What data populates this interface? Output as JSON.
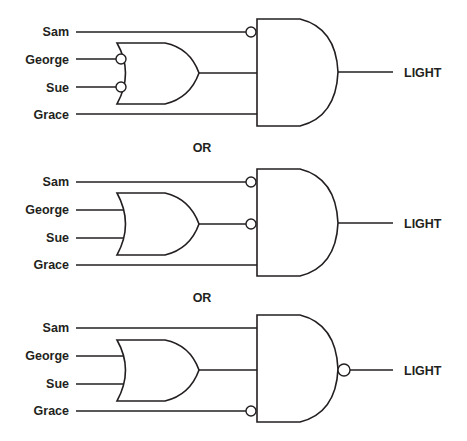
{
  "diagram": {
    "separator_label": "OR",
    "output_label": "LIGHT",
    "circuits": [
      {
        "inputs": [
          "Sam",
          "George",
          "Sue",
          "Grace"
        ],
        "or_gate": {
          "inputs": [
            "George",
            "Sue"
          ],
          "inverted_inputs": [
            "George",
            "Sue"
          ]
        },
        "and_gate": {
          "inverted_inputs": [
            "Sam"
          ],
          "inverted_output": false
        }
      },
      {
        "inputs": [
          "Sam",
          "George",
          "Sue",
          "Grace"
        ],
        "or_gate": {
          "inputs": [
            "George",
            "Sue"
          ],
          "inverted_inputs": []
        },
        "and_gate": {
          "inverted_inputs": [
            "Sam",
            "OR output"
          ],
          "inverted_output": false
        }
      },
      {
        "inputs": [
          "Sam",
          "George",
          "Sue",
          "Grace"
        ],
        "or_gate": {
          "inputs": [
            "George",
            "Sue"
          ],
          "inverted_inputs": []
        },
        "and_gate": {
          "inverted_inputs": [
            "Grace"
          ],
          "inverted_output": true
        }
      }
    ],
    "labels": {
      "c1": {
        "sam": "Sam",
        "george": "George",
        "sue": "Sue",
        "grace": "Grace",
        "out": "LIGHT"
      },
      "c2": {
        "sam": "Sam",
        "george": "George",
        "sue": "Sue",
        "grace": "Grace",
        "out": "LIGHT"
      },
      "c3": {
        "sam": "Sam",
        "george": "George",
        "sue": "Sue",
        "grace": "Grace",
        "out": "LIGHT"
      },
      "sep1": "OR",
      "sep2": "OR"
    },
    "colors": {
      "line": "#231f20",
      "background": "#ffffff"
    }
  }
}
